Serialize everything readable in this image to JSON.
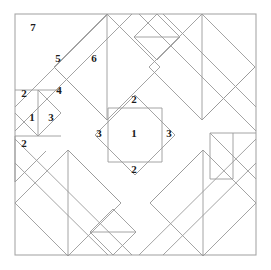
{
  "figure": {
    "background_color": "#ffffff",
    "line_color": "#9a9a9a",
    "frame_color": "#a8a8a8",
    "label_color": "#1b1b1b",
    "frame": {
      "x": 15,
      "y": 14,
      "width": 241,
      "height": 241
    },
    "labels": [
      {
        "id": "label-7",
        "text": "7",
        "x": 33,
        "y": 27
      },
      {
        "id": "label-5",
        "text": "5",
        "x": 58,
        "y": 58
      },
      {
        "id": "label-6",
        "text": "6",
        "x": 94,
        "y": 58
      },
      {
        "id": "label-2-upper-left",
        "text": "2",
        "x": 24,
        "y": 93
      },
      {
        "id": "label-4",
        "text": "4",
        "x": 59,
        "y": 90
      },
      {
        "id": "label-1-left",
        "text": "1",
        "x": 32,
        "y": 117
      },
      {
        "id": "label-3-left-small",
        "text": "3",
        "x": 51,
        "y": 117
      },
      {
        "id": "label-2-lower-left",
        "text": "2",
        "x": 24,
        "y": 143
      },
      {
        "id": "label-2-center-top",
        "text": "2",
        "x": 134,
        "y": 99
      },
      {
        "id": "label-3-center-left",
        "text": "3",
        "x": 99,
        "y": 133
      },
      {
        "id": "label-1-center",
        "text": "1",
        "x": 134,
        "y": 133
      },
      {
        "id": "label-3-center-right",
        "text": "3",
        "x": 169,
        "y": 133
      },
      {
        "id": "label-2-center-bottom",
        "text": "2",
        "x": 134,
        "y": 169
      }
    ],
    "shapes": [
      {
        "id": "outer-frame",
        "kind": "rect",
        "points": "15,14 256,14 256,255 15,255 15,14"
      },
      {
        "id": "sash-diagonal-ne",
        "kind": "polyline",
        "points": "15,107 108,14"
      },
      {
        "id": "sash-diagonal-ne-2",
        "kind": "polyline",
        "points": "15,131 132,14"
      },
      {
        "id": "sash-diagonal-se",
        "kind": "polyline",
        "points": "15,163 108,255"
      },
      {
        "id": "sash-diagonal-se-2",
        "kind": "polyline",
        "points": "15,139 132,255"
      },
      {
        "id": "sash-diagonal-nw",
        "kind": "polyline",
        "points": "256,107 163,14"
      },
      {
        "id": "sash-diagonal-nw-2",
        "kind": "polyline",
        "points": "256,131 139,14"
      },
      {
        "id": "sash-diagonal-sw",
        "kind": "polyline",
        "points": "256,163 163,255"
      },
      {
        "id": "sash-diagonal-sw-2",
        "kind": "polyline",
        "points": "256,139 139,255"
      },
      {
        "id": "center-diamond",
        "kind": "polygon",
        "points": "135,95 175,135 135,175 95,135"
      },
      {
        "id": "center-square",
        "kind": "rect",
        "points": "108,108 162,108 162,162 108,162 108,108"
      },
      {
        "id": "tl-big-diamond",
        "kind": "polygon",
        "points": "107,14 160,67 107,120 54,67"
      },
      {
        "id": "tl-diamond-chord-a",
        "kind": "polyline",
        "points": "54,67 107,120"
      },
      {
        "id": "tl-diamond-chord-b",
        "kind": "polyline",
        "points": "107,14 107,120"
      },
      {
        "id": "tl-small-square",
        "kind": "polygon",
        "points": "15,90 61,90 61,136 15,136"
      },
      {
        "id": "tl-small-diamond",
        "kind": "polygon",
        "points": "38,90 61,113 38,136 15,113"
      },
      {
        "id": "tl-small-divider",
        "kind": "polyline",
        "points": "46,90 46,136"
      },
      {
        "id": "tl-small-lower-tri",
        "kind": "polyline",
        "points": "15,136 61,136"
      },
      {
        "id": "tl-lower-left-tri",
        "kind": "polyline",
        "points": "15,136 15,182 46,136"
      },
      {
        "id": "tr-small-diamond",
        "kind": "polygon",
        "points": "157,14 180,37 157,60 134,37"
      },
      {
        "id": "tr-small-chord",
        "kind": "polyline",
        "points": "134,37 180,37"
      },
      {
        "id": "tr-big-diamond",
        "kind": "polygon",
        "points": "202,14 255,67 202,120 149,67"
      },
      {
        "id": "tr-diamond-chord-a",
        "kind": "polyline",
        "points": "255,67 202,120"
      },
      {
        "id": "tr-diamond-chord-b",
        "kind": "polyline",
        "points": "202,14 202,120"
      },
      {
        "id": "bl-big-diamond",
        "kind": "polygon",
        "points": "68,150 121,203 68,256 15,203"
      },
      {
        "id": "bl-diamond-chord-a",
        "kind": "polyline",
        "points": "15,203 68,256"
      },
      {
        "id": "bl-diamond-chord-b",
        "kind": "polyline",
        "points": "68,150 68,256"
      },
      {
        "id": "bc-small-diamond",
        "kind": "polygon",
        "points": "113,209 136,232 113,255 90,232"
      },
      {
        "id": "bc-small-chord",
        "kind": "polyline",
        "points": "90,232 136,232"
      },
      {
        "id": "br-small-square",
        "kind": "polygon",
        "points": "210,133 256,133 256,179 210,179"
      },
      {
        "id": "br-small-diamond-edge",
        "kind": "polyline",
        "points": "210,133 256,179"
      },
      {
        "id": "br-small-divider",
        "kind": "polyline",
        "points": "233,133 233,179"
      },
      {
        "id": "br-big-diamond",
        "kind": "polygon",
        "points": "203,150 256,203 203,256 150,203"
      },
      {
        "id": "br-diamond-chord-a",
        "kind": "polyline",
        "points": "256,203 203,256"
      },
      {
        "id": "br-diamond-chord-b",
        "kind": "polyline",
        "points": "203,150 203,256"
      }
    ]
  }
}
